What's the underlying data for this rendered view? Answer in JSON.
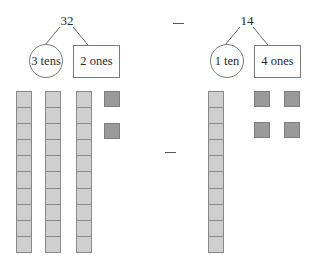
{
  "left_number": {
    "value": "32",
    "tens_label": "3 tens",
    "ones_label": "2 ones",
    "tens_count": 3,
    "ones_count": 2
  },
  "right_number": {
    "value": "14",
    "tens_label": "1 ten",
    "ones_label": "4 ones",
    "tens_count": 1,
    "ones_count": 4
  },
  "operator": "−",
  "colors": {
    "rod_fill": "#cfcfcf",
    "cube_fill": "#9a9a9a",
    "outline": "#7a7a7a"
  }
}
